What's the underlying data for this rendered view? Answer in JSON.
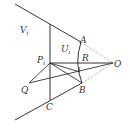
{
  "diagram": {
    "labels": {
      "V": "V",
      "V_sub": "i",
      "U": "U",
      "U_sub": "i",
      "P": "P",
      "P_sub": "i",
      "A": "A",
      "R": "R",
      "O": "O",
      "Q": "Q",
      "B": "B",
      "C": "C"
    },
    "points": {
      "P": [
        50,
        63
      ],
      "O": [
        113,
        63
      ],
      "A": [
        81,
        42
      ],
      "B": [
        82,
        83
      ],
      "C": [
        50,
        100
      ],
      "Q": [
        29,
        83
      ]
    },
    "colors": {
      "stroke": "#333333",
      "dashed": "#777777"
    }
  }
}
